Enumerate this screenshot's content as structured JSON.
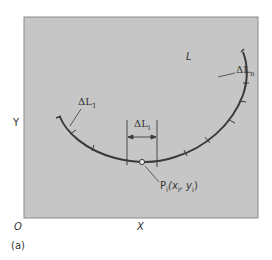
{
  "figure": {
    "caption": "(a)",
    "axes": {
      "origin_label": "O",
      "x_label": "X",
      "y_label": "Y"
    },
    "colors": {
      "panel_fill": "#c6c6c6",
      "panel_border": "#8a8a8a",
      "curve": "#3a3a3a",
      "text": "#333333"
    },
    "curve": {
      "name": "L",
      "segments_labels": {
        "first": {
          "base": "ΔL",
          "sub": "1"
        },
        "generic": {
          "base": "ΔL",
          "sub": "i"
        },
        "last": {
          "base": "ΔL",
          "sub": "n"
        }
      },
      "point": {
        "base": "P",
        "sub": "i",
        "coords_text_prefix": "(x",
        "x_sub": "i",
        "comma": ", y",
        "y_sub": "i",
        "coords_text_suffix": ")"
      }
    }
  }
}
